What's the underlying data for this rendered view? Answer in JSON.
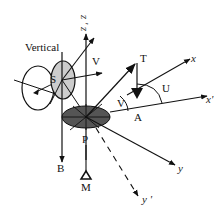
{
  "diagram": {
    "title": "",
    "labels": {
      "vertical": "Vertical",
      "z_prime": "z '",
      "z": "z",
      "S": "S",
      "V_upper": "V",
      "T": "T",
      "x": "x",
      "U": "U",
      "V_angle": "V",
      "x_prime": "x'",
      "A": "A",
      "P": "P",
      "B": "B",
      "M": "M",
      "y": "y",
      "y_prime": "y '"
    },
    "colors": {
      "line": "#111111",
      "disk_fill": "#555555",
      "s_ellipse_fill": "#cccccc",
      "background": "#ffffff"
    }
  }
}
